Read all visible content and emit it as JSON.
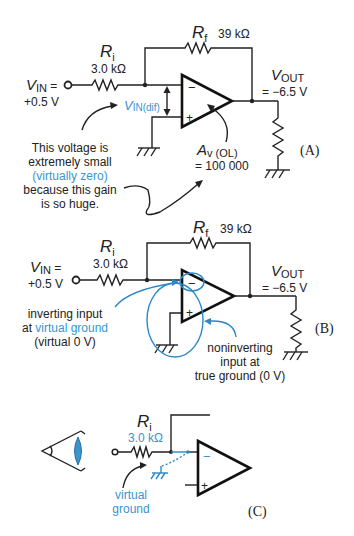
{
  "colors": {
    "ink": "#222222",
    "accent_blue": "#3a95cf"
  },
  "panel_a": {
    "label": "(A)",
    "ri_symbol": "R",
    "ri_sub": "i",
    "ri_value": "3.0 kΩ",
    "rf_symbol": "R",
    "rf_sub": "f",
    "rf_value": "39 kΩ",
    "vin_symbol": "V",
    "vin_sub": "IN",
    "vin_eq": " =",
    "vin_value": "+0.5 V",
    "vout_symbol": "V",
    "vout_sub": "OUT",
    "vout_value": "= −6.5 V",
    "vdif_symbol": "V",
    "vdif_sub": "IN(dif)",
    "gain_symbol": "A",
    "gain_sub": "v (OL)",
    "gain_value": "= 100 000",
    "minus": "−",
    "plus": "+",
    "note_lines": [
      "This voltage is",
      "extremely small",
      "(virtually zero)",
      "because this gain",
      "is so huge."
    ]
  },
  "panel_b": {
    "label": "(B)",
    "ri_symbol": "R",
    "ri_sub": "i",
    "ri_value": "3.0 kΩ",
    "rf_symbol": "R",
    "rf_sub": "f",
    "rf_value": "39 kΩ",
    "vin_symbol": "V",
    "vin_sub": "IN",
    "vin_eq": " =",
    "vin_value": "+0.5 V",
    "vout_symbol": "V",
    "vout_sub": "OUT",
    "vout_value": "= −6.5 V",
    "minus": "−",
    "plus": "+",
    "inverting_note": [
      "inverting input",
      "at ",
      "virtual ground",
      "(virtual 0 V)"
    ],
    "noninverting_note": [
      "noninverting",
      "input at",
      "true ground (0 V)"
    ]
  },
  "panel_c": {
    "label": "(C)",
    "ri_symbol": "R",
    "ri_sub": "i",
    "ri_value": "3.0 kΩ",
    "minus": "−",
    "plus": "+",
    "virtual_ground_note": [
      "virtual",
      "ground"
    ]
  }
}
